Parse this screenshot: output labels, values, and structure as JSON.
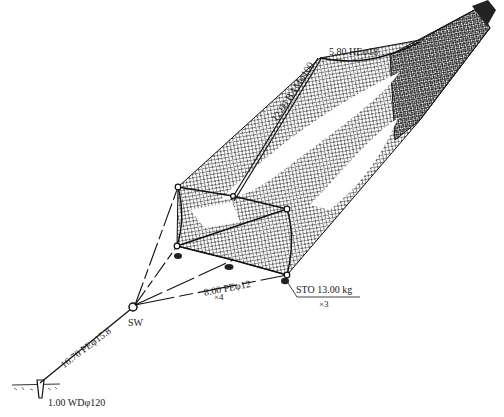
{
  "diagram": {
    "type": "fishing-net-rigging",
    "colors": {
      "ink": "#1a1a1a",
      "background": "#ffffff"
    },
    "labels": {
      "bamboo_pole": "12.00 BAMφ100",
      "head_line": "5.80 HEφ18",
      "bridle": "8.00 PEφ12",
      "bridle_count": "×4",
      "sinker": "STO 13.00 kg",
      "sinker_count": "×3",
      "main_line": "16.70 PEφ15.8",
      "swivel": "SW",
      "anchor_stake": "1.00 WDφ120"
    }
  }
}
